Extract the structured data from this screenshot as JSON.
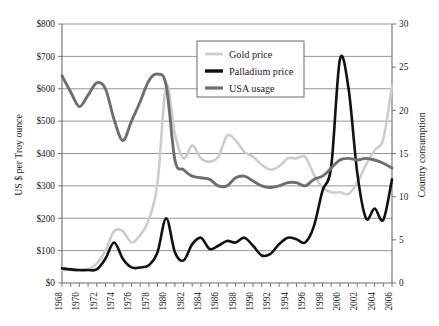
{
  "chart_data": {
    "type": "line",
    "title": "",
    "xlabel": "",
    "ylabel": "US $ per Troy ounce",
    "y2label": "Country consumption",
    "grid": true,
    "legend_position": "top-center",
    "xlim": [
      1968,
      2006
    ],
    "ylim": [
      0,
      800
    ],
    "y2lim": [
      0,
      30
    ],
    "y_ticks": [
      "$0",
      "$100",
      "$200",
      "$300",
      "$400",
      "$500",
      "$600",
      "$700",
      "$800"
    ],
    "y_tick_values": [
      0,
      100,
      200,
      300,
      400,
      500,
      600,
      700,
      800
    ],
    "y2_ticks": [
      "0",
      "5",
      "10",
      "15",
      "20",
      "25",
      "30"
    ],
    "y2_tick_values": [
      0,
      5,
      10,
      15,
      20,
      25,
      30
    ],
    "x_tick_labels": [
      "1968",
      "1970",
      "1972",
      "1974",
      "1976",
      "1978",
      "1980",
      "1982",
      "1984",
      "1986",
      "1988",
      "1990",
      "1992",
      "1994",
      "1996",
      "1998",
      "2000",
      "2002",
      "2004",
      "2006"
    ],
    "x": [
      1968,
      1969,
      1970,
      1971,
      1972,
      1973,
      1974,
      1975,
      1976,
      1977,
      1978,
      1979,
      1980,
      1981,
      1982,
      1983,
      1984,
      1985,
      1986,
      1987,
      1988,
      1989,
      1990,
      1991,
      1992,
      1993,
      1994,
      1995,
      1996,
      1997,
      1998,
      1999,
      2000,
      2001,
      2002,
      2003,
      2004,
      2005,
      2006
    ],
    "series": [
      {
        "name": "Gold price",
        "color": "#cdcdcd",
        "axis": "left",
        "width": 2.6,
        "values": [
          40,
          40,
          38,
          42,
          60,
          100,
          160,
          160,
          125,
          148,
          195,
          310,
          610,
          460,
          385,
          425,
          385,
          375,
          390,
          455,
          440,
          405,
          390,
          365,
          350,
          360,
          385,
          385,
          390,
          335,
          295,
          280,
          280,
          275,
          310,
          365,
          410,
          445,
          610
        ]
      },
      {
        "name": "Palladium price",
        "color": "#111111",
        "axis": "left",
        "width": 2.6,
        "values": [
          45,
          42,
          40,
          40,
          42,
          75,
          125,
          75,
          48,
          48,
          55,
          95,
          200,
          95,
          70,
          120,
          140,
          105,
          115,
          130,
          125,
          140,
          115,
          85,
          90,
          120,
          140,
          135,
          125,
          175,
          285,
          360,
          690,
          600,
          340,
          200,
          230,
          195,
          320
        ]
      },
      {
        "name": "USA usage",
        "color": "#6e6e6e",
        "axis": "left",
        "width": 2.9,
        "values": [
          640,
          590,
          545,
          580,
          618,
          600,
          505,
          440,
          500,
          560,
          625,
          645,
          610,
          380,
          350,
          330,
          325,
          320,
          300,
          300,
          325,
          330,
          315,
          300,
          295,
          300,
          310,
          310,
          300,
          320,
          330,
          355,
          380,
          385,
          380,
          385,
          380,
          370,
          355
        ]
      }
    ],
    "series_right_axis_note": "USA usage plotted against right axis: value/800*30 country consumption units"
  },
  "legend": {
    "items": [
      {
        "label": "Gold price"
      },
      {
        "label": "Palladium price"
      },
      {
        "label": "USA usage"
      }
    ]
  },
  "axes": {
    "left_title": "US $ per Troy ounce",
    "right_title": "Country consumption"
  }
}
